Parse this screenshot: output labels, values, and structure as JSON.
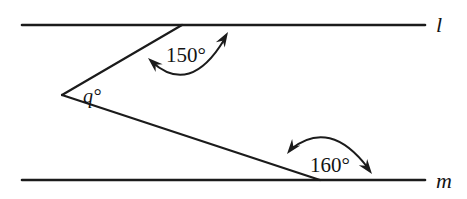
{
  "figure": {
    "kind": "geometry-diagram",
    "background_color": "#ffffff",
    "ink_color": "#1b1b1b",
    "width": 467,
    "height": 199
  },
  "lines": {
    "top": {
      "name": "l",
      "y": 25,
      "x_start": 22,
      "x_end": 425,
      "label_x": 436,
      "label_y": 32
    },
    "bottom": {
      "name": "m",
      "y": 180,
      "x_start": 22,
      "x_end": 425,
      "label_x": 436,
      "label_y": 188
    }
  },
  "vertex": {
    "x": 62,
    "y": 95,
    "label": "q°",
    "label_x": 92,
    "label_y": 103
  },
  "rays": {
    "upper": {
      "from_x": 62,
      "from_y": 95,
      "to_x": 182,
      "to_y": 25
    },
    "lower": {
      "from_x": 62,
      "from_y": 95,
      "to_x": 320,
      "to_y": 180
    }
  },
  "angles": [
    {
      "id": "angle-top",
      "label": "150°",
      "value": 150,
      "unit": "degrees",
      "label_x": 186,
      "label_y": 62,
      "arc_path": "M 152 62 Q 190 96 224 40",
      "arrow_start": {
        "x": 148,
        "y": 58,
        "rotation": 222
      },
      "arrow_end": {
        "x": 228,
        "y": 32,
        "rotation": 301
      }
    },
    {
      "id": "angle-bottom",
      "label": "160°",
      "value": 160,
      "unit": "degrees",
      "label_x": 330,
      "label_y": 172,
      "arc_path": "M 291 149 Q 330 118 368 168",
      "arrow_start": {
        "x": 287,
        "y": 154,
        "rotation": 128
      },
      "arrow_end": {
        "x": 372,
        "y": 174,
        "rotation": 53
      }
    }
  ]
}
